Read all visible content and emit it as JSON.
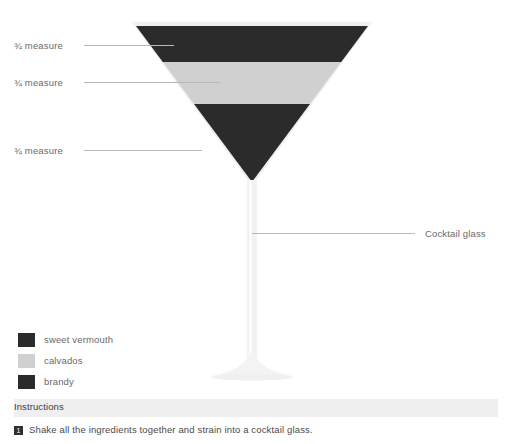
{
  "diagram": {
    "glass": {
      "type": "cocktail glass",
      "callout_label": "Cocktail glass",
      "outline_color": "#f0f0f0",
      "rim_left_x": 132,
      "rim_right_x": 372,
      "rim_y": 22,
      "bowl_tip_y": 182,
      "stem_bottom_y": 370
    },
    "measure_callouts": [
      {
        "label": "¾ measure",
        "layer": "sweet vermouth",
        "y": 45
      },
      {
        "label": "¾ measure",
        "layer": "calvados",
        "y": 82
      },
      {
        "label": "¾ measure",
        "layer": "brandy",
        "y": 150
      }
    ],
    "layers": [
      {
        "name": "sweet vermouth",
        "color": "#2b2b2b",
        "top_y": 26,
        "bottom_y": 62
      },
      {
        "name": "calvados",
        "color": "#d0d0d0",
        "top_y": 62,
        "bottom_y": 104
      },
      {
        "name": "brandy",
        "color": "#2b2b2b",
        "top_y": 104,
        "bottom_y": 182
      }
    ]
  },
  "legend": {
    "items": [
      {
        "label": "sweet vermouth",
        "color": "#2b2b2b"
      },
      {
        "label": "calvados",
        "color": "#d0d0d0"
      },
      {
        "label": "brandy",
        "color": "#2b2b2b"
      }
    ]
  },
  "instructions": {
    "title": "Instructions",
    "steps": [
      {
        "number": "1",
        "text": "Shake all the ingredients together and strain into a cocktail glass."
      }
    ]
  }
}
